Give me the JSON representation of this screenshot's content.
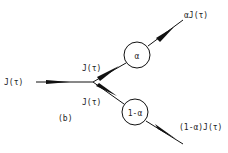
{
  "diagram": {
    "panel_label": "(b)",
    "input": {
      "label": "J(τ)"
    },
    "branches": [
      {
        "edge_label": "J(τ)",
        "node_label": "α",
        "output_label": "αJ(τ)"
      },
      {
        "edge_label": "J(τ)",
        "node_label": "1-α",
        "output_label": "(1-α)J(τ)"
      }
    ],
    "colors": {
      "stroke": "#111111",
      "background": "#ffffff",
      "text": "#222222"
    }
  }
}
